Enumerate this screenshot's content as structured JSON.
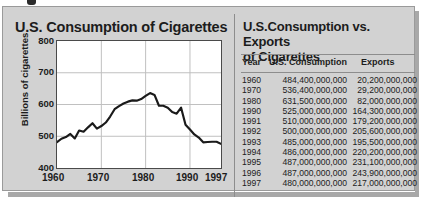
{
  "chart_data": [
    {
      "type": "line",
      "title": "U.S. Consumption of Cigarettes",
      "xlabel": "",
      "ylabel": "Billions of cigarettes",
      "ylim": [
        400,
        800
      ],
      "yticks": [
        400,
        500,
        600,
        700,
        800
      ],
      "xlim": [
        1960,
        1997
      ],
      "xticks": [
        1960,
        1970,
        1980,
        1990,
        1997
      ],
      "grid": true,
      "legend": "none",
      "x": [
        1960,
        1961,
        1962,
        1963,
        1964,
        1965,
        1966,
        1967,
        1968,
        1969,
        1970,
        1971,
        1972,
        1973,
        1974,
        1975,
        1976,
        1977,
        1978,
        1979,
        1980,
        1981,
        1982,
        1983,
        1984,
        1985,
        1986,
        1987,
        1988,
        1989,
        1990,
        1991,
        1992,
        1993,
        1994,
        1995,
        1996,
        1997
      ],
      "values": [
        484,
        495,
        500,
        510,
        497,
        522,
        518,
        532,
        545,
        528,
        536,
        547,
        566,
        589,
        599,
        607,
        613,
        617,
        616,
        621,
        631,
        640,
        634,
        600,
        600,
        594,
        580,
        575,
        594,
        540,
        525,
        510,
        500,
        485,
        486,
        487,
        487,
        480
      ]
    },
    {
      "type": "table",
      "title": "U.S.Consumption vs. Exports of Cigarettes",
      "columns": [
        "Year",
        "U.S. Consumption",
        "Exports"
      ],
      "rows": [
        [
          "1960",
          "484,400,000,000",
          "20,200,000,000"
        ],
        [
          "1970",
          "536,400,000,000",
          "29,200,000,000"
        ],
        [
          "1980",
          "631,500,000,000",
          "82,000,000,000"
        ],
        [
          "1990",
          "525,000,000,000",
          "164,300,000,000"
        ],
        [
          "1991",
          "510,000,000,000",
          "179,200,000,000"
        ],
        [
          "1992",
          "500,000,000,000",
          "205,600,000,000"
        ],
        [
          "1993",
          "485,000,000,000",
          "195,500,000,000"
        ],
        [
          "1994",
          "486,000,000,000",
          "220,200,000,000"
        ],
        [
          "1995",
          "487,000,000,000",
          "231,100,000,000"
        ],
        [
          "1996",
          "487,000,000,000",
          "243,900,000,000"
        ],
        [
          "1997",
          "480,000,000,000",
          "217,000,000,000"
        ]
      ]
    }
  ],
  "chart": {
    "title": "U.S. Consumption of Cigarettes",
    "ylabel": "Billions of cigarettes",
    "yticks": [
      "800",
      "700",
      "600",
      "500",
      "400"
    ],
    "xticks": [
      "1960",
      "1970",
      "1980",
      "1990",
      "1997"
    ]
  },
  "table": {
    "title_line1": "U.S.Consumption vs. Exports",
    "title_line2": "of Cigarettes",
    "headers": {
      "year": "Year",
      "consumption": "U.S. Consumption",
      "exports": "Exports"
    }
  },
  "colors": {
    "panel_background": "#d2d2d2",
    "plot_background": "#ffffff",
    "line": "#1a1a1a",
    "grid": "#bfbfbf",
    "text": "#1c1c1c",
    "shadow": "#a8a8a8"
  }
}
